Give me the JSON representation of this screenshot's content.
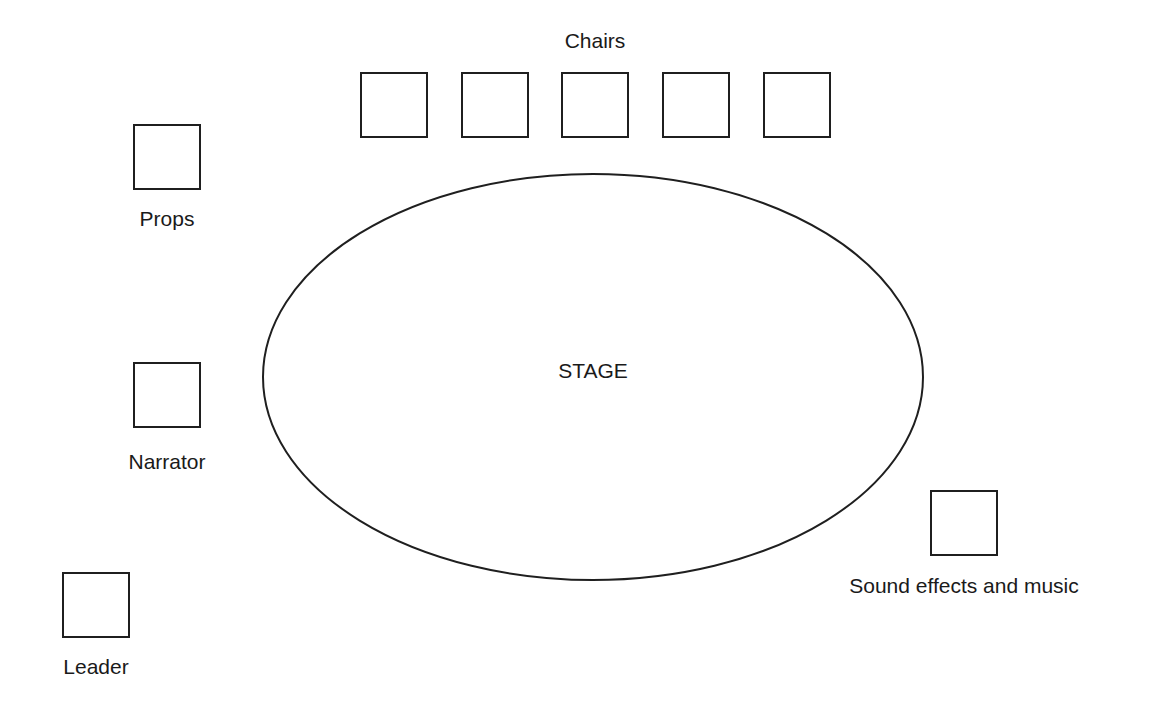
{
  "diagram": {
    "stage": {
      "label": "STAGE",
      "cx": 593,
      "cy": 377,
      "rx": 330,
      "ry": 203
    },
    "chairs": {
      "label": "Chairs",
      "label_pos": {
        "x": 595,
        "y": 30
      },
      "boxes": [
        {
          "x": 360,
          "y": 72
        },
        {
          "x": 461,
          "y": 72
        },
        {
          "x": 561,
          "y": 72
        },
        {
          "x": 662,
          "y": 72
        },
        {
          "x": 763,
          "y": 72
        }
      ]
    },
    "stations": [
      {
        "id": "props",
        "label": "Props",
        "box": {
          "x": 133,
          "y": 124
        },
        "label_pos": {
          "x": 167,
          "y": 208
        }
      },
      {
        "id": "narrator",
        "label": "Narrator",
        "box": {
          "x": 133,
          "y": 362
        },
        "label_pos": {
          "x": 167,
          "y": 451
        }
      },
      {
        "id": "leader",
        "label": "Leader",
        "box": {
          "x": 62,
          "y": 572
        },
        "label_pos": {
          "x": 96,
          "y": 656
        }
      },
      {
        "id": "sound",
        "label": "Sound effects and music",
        "box": {
          "x": 930,
          "y": 490
        },
        "label_pos": {
          "x": 964,
          "y": 575
        }
      }
    ]
  },
  "colors": {
    "stroke": "#1f1f1f",
    "background": "#ffffff",
    "text": "#1a1a1a"
  }
}
